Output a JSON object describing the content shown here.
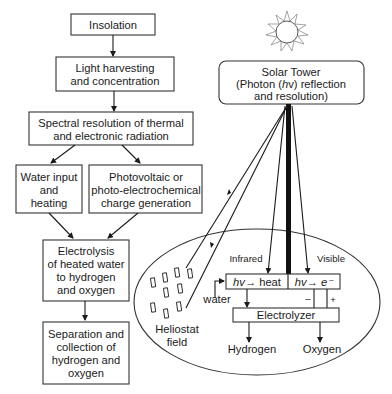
{
  "flowchart": {
    "insolation": "Insolation",
    "light_harvesting": [
      "Light harvesting",
      "and concentration"
    ],
    "spectral_resolution": [
      "Spectral resolution of thermal",
      "and electronic radiation"
    ],
    "water_input": [
      "Water input",
      "and",
      "heating"
    ],
    "photovoltaic": [
      "Photovoltaic or",
      "photo-electrochemical",
      "charge generation"
    ],
    "electrolysis": [
      "Electrolysis",
      "of heated water",
      "to hydrogen",
      "and oxygen"
    ],
    "separation": [
      "Separation and",
      "collection of",
      "hydrogen and",
      "oxygen"
    ]
  },
  "tower": {
    "title": "Solar Tower",
    "line2_pre": "(Photon (",
    "line2_italic": "h",
    "line2_post": "v) reflection",
    "line3": "and resolution)"
  },
  "field": {
    "infrared": "Infrared",
    "visible": "Visible",
    "heat_box": {
      "hv": "hv",
      "arrow": "→",
      "label": "heat"
    },
    "electron_box": {
      "hv": "hv",
      "arrow": "→",
      "label": "e⁻"
    },
    "water": "water",
    "minus": "–",
    "plus": "+",
    "electrolyzer": "Electrolyzer",
    "hydrogen": "Hydrogen",
    "oxygen": "Oxygen",
    "heliostat": [
      "Heliostat",
      "field"
    ]
  },
  "icons": {
    "sun": "sun-icon"
  }
}
